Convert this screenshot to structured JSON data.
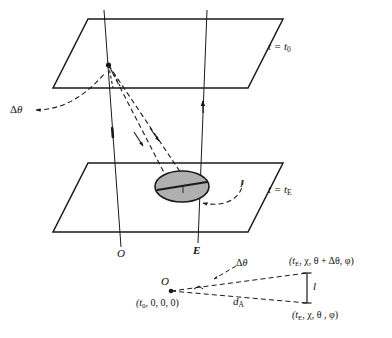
{
  "figure": {
    "type": "diagram",
    "background_color": "#ffffff",
    "line_color": "#1a1a1a",
    "ellipse_fill": "#b0b0b0"
  },
  "main_diagram": {
    "top_plane": {
      "name": "constant-time hypersurface at emission-observation time t0",
      "label_prefix": "t = t",
      "label_sub": "0"
    },
    "bottom_plane": {
      "name": "constant-time hypersurface at emission time tE",
      "label_prefix": "t = t",
      "label_sub": "E"
    },
    "observer_worldline_label": "O",
    "emitter_worldline_label": "E",
    "delta_theta_label_prefix": "Δ",
    "delta_theta_label_symbol": "θ",
    "proper_length_label": "l",
    "source_object": "shaded ellipse of proper length l on the t = tE surface"
  },
  "inset_diagram": {
    "origin_label": "O",
    "origin_coords": "(t",
    "origin_coords_sub": "0",
    "origin_coords_rest": ", 0, 0, 0)",
    "delta_theta_prefix": "Δ",
    "delta_theta_symbol": "θ",
    "distance_label": "d",
    "distance_label_sub": "A",
    "length_label": "l",
    "upper_point_open": "(t",
    "upper_point_sub": "E",
    "upper_point_rest": ", χ, θ + Δθ, φ)",
    "lower_point_open": "(t",
    "lower_point_sub": "E",
    "lower_point_rest": ", χ, θ , φ)"
  }
}
